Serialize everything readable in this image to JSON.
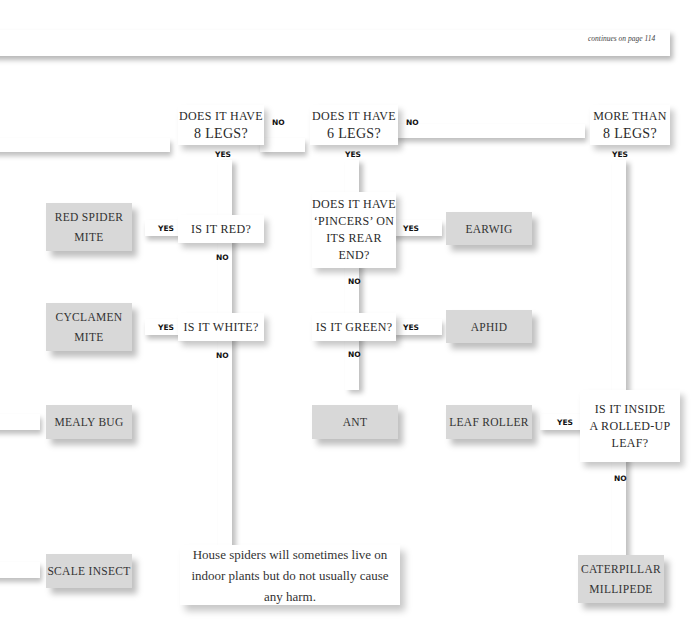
{
  "page": {
    "continues_note": "continues on page 114"
  },
  "questions": {
    "q_8legs": {
      "line1": "DOES IT HAVE",
      "line2": "8 LEGS?"
    },
    "q_6legs": {
      "line1": "DOES IT HAVE",
      "line2": "6 LEGS?"
    },
    "q_more8": {
      "line1": "MORE THAN",
      "line2": "8 LEGS?"
    },
    "q_red": {
      "line1": "IS IT RED?"
    },
    "q_white": {
      "line1": "IS IT WHITE?"
    },
    "q_pincers": {
      "line1": "DOES IT HAVE",
      "line2": "‘PINCERS’ ON",
      "line3": "ITS REAR",
      "line4": "END?"
    },
    "q_green": {
      "line1": "IS IT GREEN?"
    },
    "q_rolled": {
      "line1": "IS IT INSIDE",
      "line2": "A ROLLED-UP",
      "line3": "LEAF?"
    }
  },
  "answers": {
    "red_spider_mite": {
      "line1": "RED SPIDER",
      "line2": "MITE"
    },
    "cyclamen_mite": {
      "line1": "CYCLAMEN",
      "line2": "MITE"
    },
    "mealy_bug": {
      "line1": "MEALY BUG"
    },
    "scale_insect": {
      "line1": "SCALE INSECT"
    },
    "earwig": {
      "line1": "EARWIG"
    },
    "aphid": {
      "line1": "APHID"
    },
    "ant": {
      "line1": "ANT"
    },
    "leaf_roller": {
      "line1": "LEAF ROLLER"
    },
    "caterpillar_millipede": {
      "line1": "CATERPILLAR",
      "line2": "MILLIPEDE"
    }
  },
  "note": {
    "text": "House spiders will sometimes live on indoor plants but do not usually cause any harm."
  },
  "labels": {
    "yes": "YES",
    "no": "NO"
  }
}
